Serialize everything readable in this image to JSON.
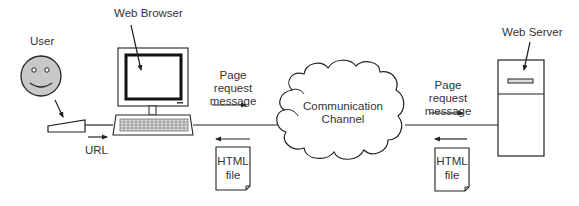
{
  "diagram": {
    "labels": {
      "user": "User",
      "web_browser": "Web Browser",
      "url": "URL",
      "page_request_left": "Page request\nmessage",
      "page_request_right": "Page request\nmessage",
      "channel": "Communication\nChannel",
      "web_server": "Web Server",
      "html_file_left": "HTML\nfile",
      "html_file_right": "HTML\nfile"
    },
    "nodes": [
      {
        "id": "user",
        "label": "User",
        "icon": "smiley-face-icon"
      },
      {
        "id": "browser",
        "label": "Web Browser",
        "icon": "desktop-computer-icon"
      },
      {
        "id": "channel",
        "label": "Communication Channel",
        "icon": "cloud-icon"
      },
      {
        "id": "server",
        "label": "Web Server",
        "icon": "server-tower-icon"
      }
    ],
    "flows": [
      {
        "from": "user",
        "to": "browser",
        "label": "URL",
        "direction": "right"
      },
      {
        "from": "browser",
        "to": "channel",
        "label": "Page request message",
        "direction": "right"
      },
      {
        "from": "channel",
        "to": "browser",
        "label": "HTML file",
        "direction": "left"
      },
      {
        "from": "channel",
        "to": "server",
        "label": "Page request message",
        "direction": "right"
      },
      {
        "from": "server",
        "to": "channel",
        "label": "HTML file",
        "direction": "left"
      }
    ],
    "colors": {
      "stroke": "#222222",
      "face_fill": "#c8c8c8",
      "text": "#333333",
      "background": "#ffffff"
    }
  }
}
